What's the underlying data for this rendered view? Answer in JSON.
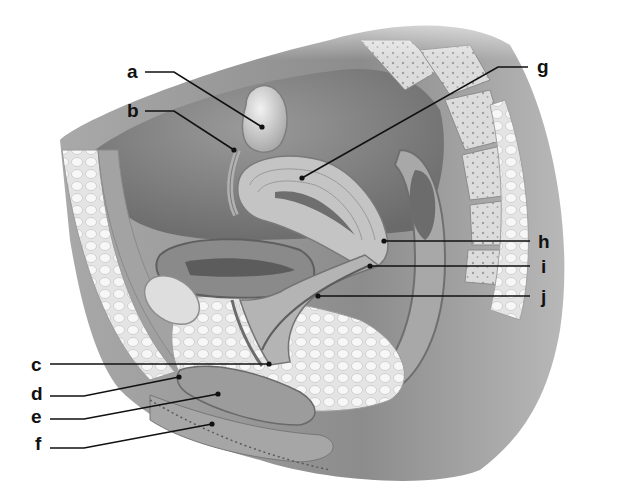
{
  "figure": {
    "background_color": "#ffffff",
    "line_color": "#111111",
    "tissue_colors": {
      "skin": "#8f8f8f",
      "skin_light": "#bdbdbd",
      "fat": "#e6e6e6",
      "fat_cells": "#f6f6f6",
      "muscle": "#9a9a9a",
      "organ": "#b8b8b8",
      "organ_dark": "#7d7d7d",
      "cavity": "#6e6e6e",
      "bone": "#d9d9d9",
      "bone_dots": "#9e9e9e"
    }
  },
  "labels": [
    {
      "id": "a",
      "text": "a",
      "x": 127,
      "y": 62,
      "line": [
        [
          145,
          72
        ],
        [
          174,
          72
        ],
        [
          262,
          127
        ]
      ]
    },
    {
      "id": "b",
      "text": "b",
      "x": 127,
      "y": 101,
      "line": [
        [
          145,
          111
        ],
        [
          174,
          111
        ],
        [
          234,
          150
        ]
      ]
    },
    {
      "id": "g",
      "text": "g",
      "x": 537,
      "y": 57,
      "line": [
        [
          528,
          67
        ],
        [
          498,
          67
        ],
        [
          302,
          178
        ]
      ]
    },
    {
      "id": "h",
      "text": "h",
      "x": 538,
      "y": 232,
      "line": [
        [
          384,
          241
        ],
        [
          530,
          241
        ]
      ]
    },
    {
      "id": "i",
      "text": "i",
      "x": 541,
      "y": 257,
      "line": [
        [
          370,
          266
        ],
        [
          530,
          266
        ]
      ]
    },
    {
      "id": "j",
      "text": "j",
      "x": 541,
      "y": 287,
      "line": [
        [
          318,
          296
        ],
        [
          530,
          296
        ]
      ]
    },
    {
      "id": "c",
      "text": "c",
      "x": 31,
      "y": 355,
      "line": [
        [
          50,
          364
        ],
        [
          269,
          364
        ]
      ]
    },
    {
      "id": "d",
      "text": "d",
      "x": 31,
      "y": 384,
      "line": [
        [
          50,
          396
        ],
        [
          84,
          396
        ],
        [
          179,
          377
        ]
      ]
    },
    {
      "id": "e",
      "text": "e",
      "x": 31,
      "y": 407,
      "line": [
        [
          50,
          419
        ],
        [
          84,
          419
        ],
        [
          218,
          394
        ]
      ]
    },
    {
      "id": "f",
      "text": "f",
      "x": 35,
      "y": 434,
      "line": [
        [
          50,
          448
        ],
        [
          84,
          448
        ],
        [
          212,
          424
        ]
      ]
    }
  ]
}
